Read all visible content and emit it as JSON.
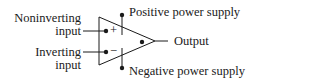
{
  "diagram": {
    "type": "op-amp symbol",
    "labels": {
      "noninverting_1": "Noninverting",
      "noninverting_2": "input",
      "inverting_1": "Inverting",
      "inverting_2": "input",
      "positive_supply": "Positive power supply",
      "negative_supply": "Negative power supply",
      "output": "Output",
      "plus_sign": "+",
      "minus_sign": "−"
    },
    "colors": {
      "stroke": "#1a1a1a",
      "background": "#ffffff"
    }
  }
}
